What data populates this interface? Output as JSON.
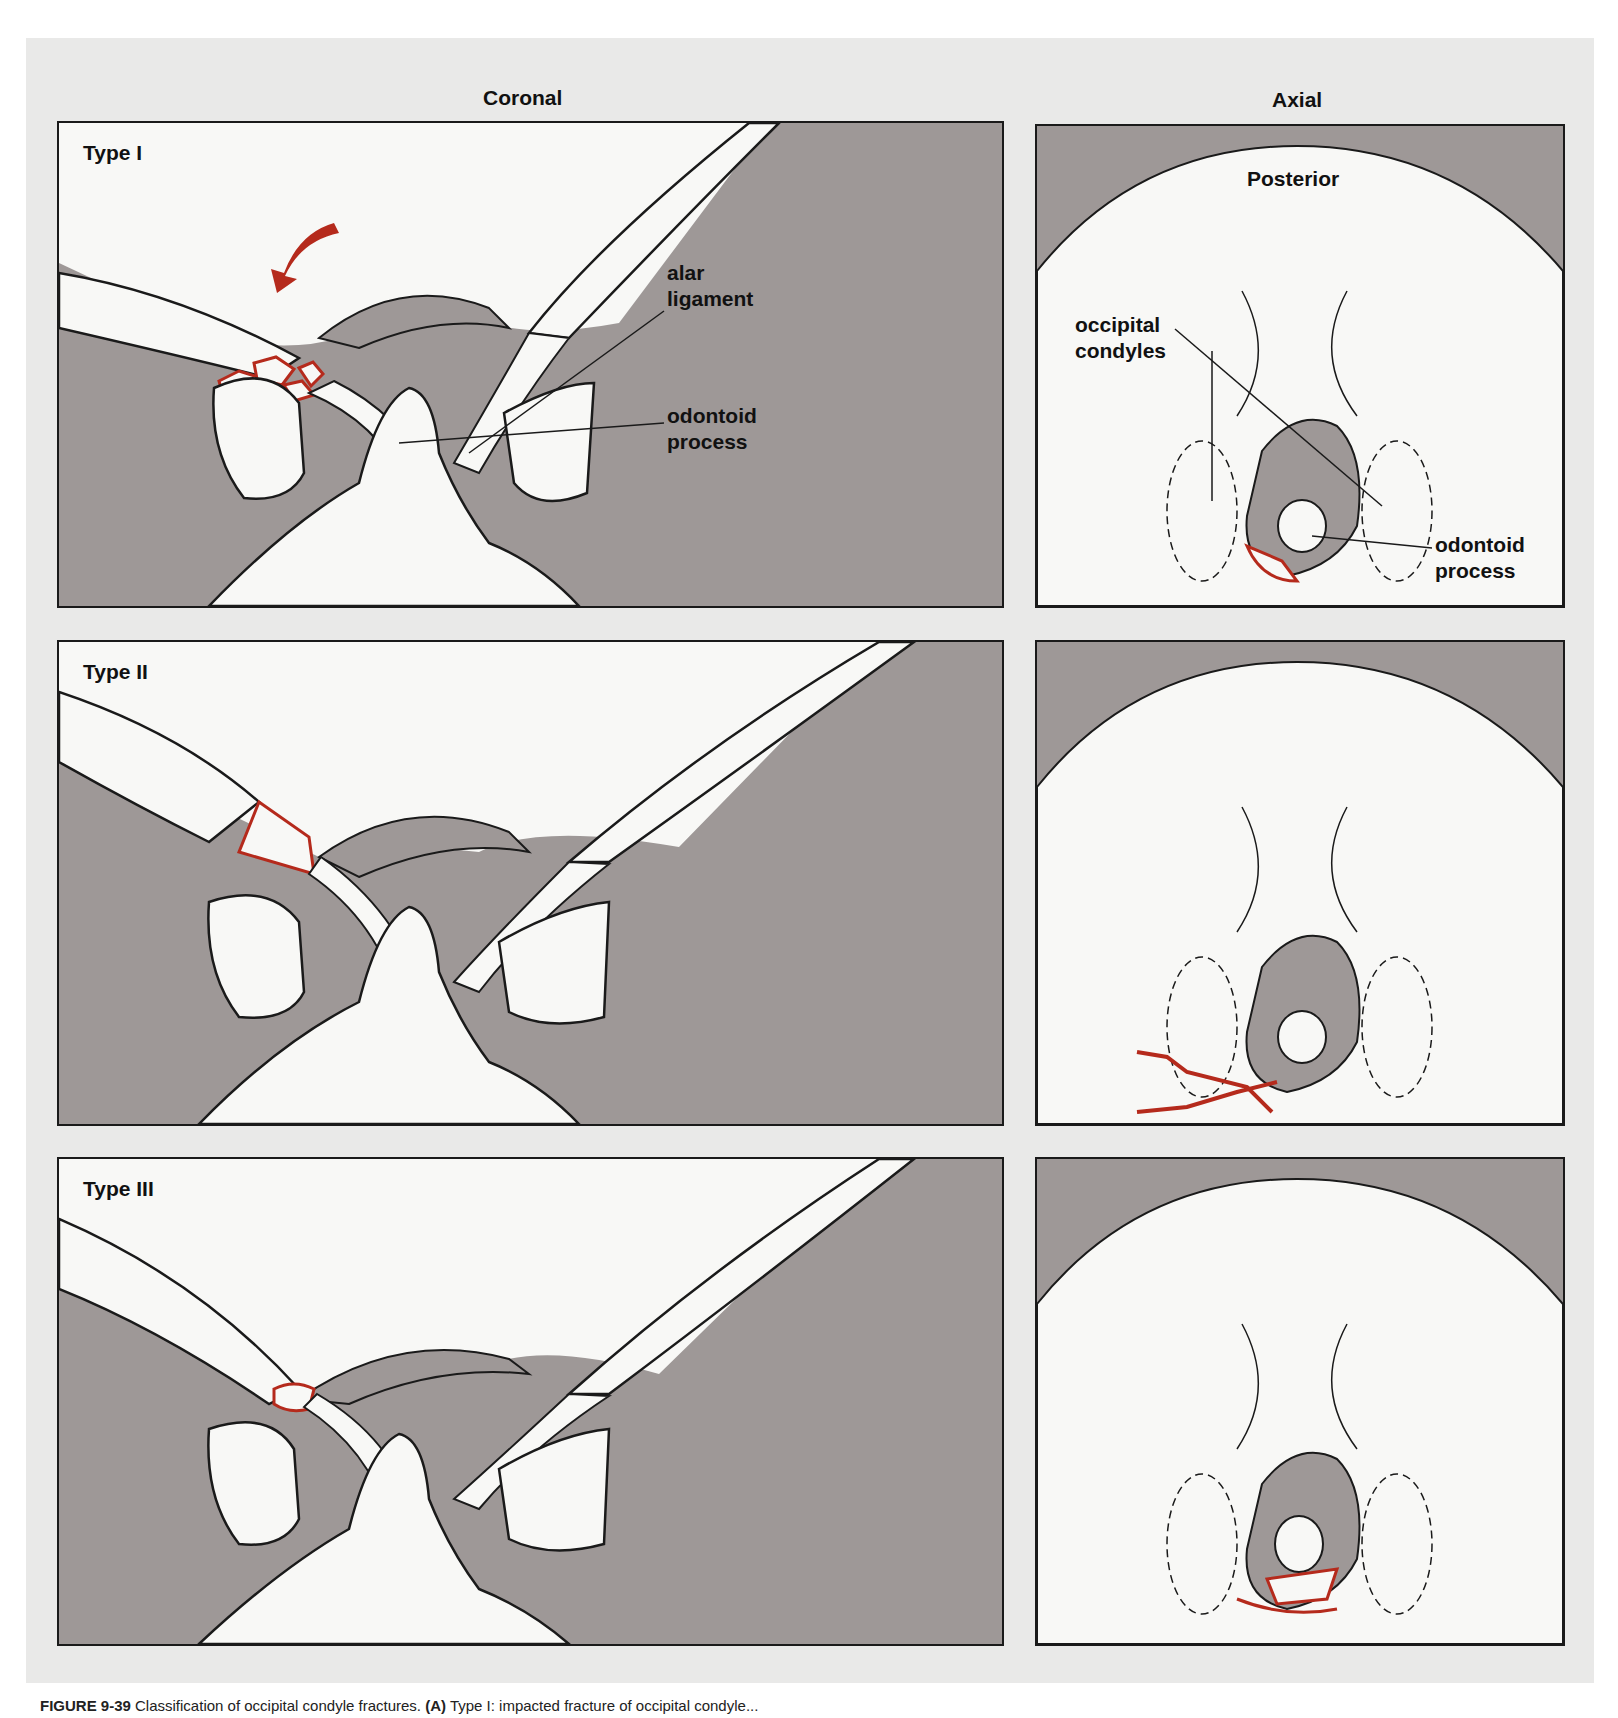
{
  "figure": {
    "columns": {
      "coronal": "Coronal",
      "axial": "Axial"
    },
    "colors": {
      "backdrop": "#e9e9e8",
      "soft_tissue": "#9e9897",
      "bone": "#f8f8f6",
      "outline": "#1a1a1a",
      "fracture_red": "#b52a1c"
    },
    "rows": [
      {
        "type_label": "Type I",
        "coronal_callouts": [
          {
            "text": "alar\nligament"
          },
          {
            "text": "odontoid\nprocess"
          }
        ],
        "axial_orientation": "Posterior",
        "axial_callouts": [
          {
            "text": "occipital\ncondyles"
          },
          {
            "text": "odontoid\nprocess"
          }
        ],
        "mechanism_arrow": "curved-red-arrow"
      },
      {
        "type_label": "Type II"
      },
      {
        "type_label": "Type III"
      }
    ],
    "caption": {
      "label": "FIGURE 9-39",
      "text": "Classification of occipital condyle fractures.",
      "part_label": "(A)",
      "part_text": "Type I: impacted fracture of occipital condyle..."
    }
  }
}
